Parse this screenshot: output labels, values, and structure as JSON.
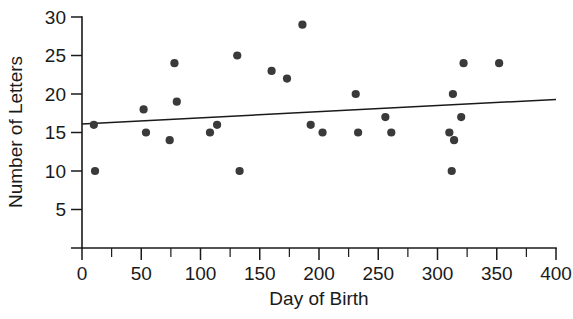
{
  "chart_data": {
    "type": "scatter",
    "title": "",
    "xlabel": "Day of Birth",
    "ylabel": "Number of Letters",
    "xlim": [
      0,
      400
    ],
    "ylim": [
      0,
      30
    ],
    "xticks": [
      0,
      50,
      100,
      150,
      200,
      250,
      300,
      350,
      400
    ],
    "xtick_labels": [
      "0",
      "50",
      "100",
      "150",
      "200",
      "250",
      "300",
      "350",
      "400"
    ],
    "xminor_step": 25,
    "yticks": [
      5,
      10,
      15,
      20,
      25,
      30
    ],
    "ytick_labels": [
      "5",
      "10",
      "15",
      "20",
      "25",
      "30"
    ],
    "grid": false,
    "legend": "none",
    "point_color": "#3a3a3a",
    "line_color": "#1a1a1a",
    "axis_color": "#1a1a1a",
    "background_color": "#ffffff",
    "points": [
      {
        "x": 10,
        "y": 16
      },
      {
        "x": 11,
        "y": 10
      },
      {
        "x": 52,
        "y": 18
      },
      {
        "x": 54,
        "y": 15
      },
      {
        "x": 74,
        "y": 14
      },
      {
        "x": 78,
        "y": 24
      },
      {
        "x": 80,
        "y": 19
      },
      {
        "x": 108,
        "y": 15
      },
      {
        "x": 114,
        "y": 16
      },
      {
        "x": 131,
        "y": 25
      },
      {
        "x": 133,
        "y": 10
      },
      {
        "x": 160,
        "y": 23
      },
      {
        "x": 173,
        "y": 22
      },
      {
        "x": 186,
        "y": 29
      },
      {
        "x": 193,
        "y": 16
      },
      {
        "x": 203,
        "y": 15
      },
      {
        "x": 231,
        "y": 20
      },
      {
        "x": 233,
        "y": 15
      },
      {
        "x": 256,
        "y": 17
      },
      {
        "x": 261,
        "y": 15
      },
      {
        "x": 310,
        "y": 15
      },
      {
        "x": 312,
        "y": 10
      },
      {
        "x": 313,
        "y": 20
      },
      {
        "x": 314,
        "y": 14
      },
      {
        "x": 320,
        "y": 17
      },
      {
        "x": 322,
        "y": 24
      },
      {
        "x": 352,
        "y": 24
      }
    ],
    "trend_line": {
      "type": "linear-fit",
      "x_start": 0,
      "y_start": 16.1,
      "x_end": 400,
      "y_end": 19.3
    }
  },
  "axes": {
    "x_title": "Day of Birth",
    "y_title": "Number of Letters"
  }
}
